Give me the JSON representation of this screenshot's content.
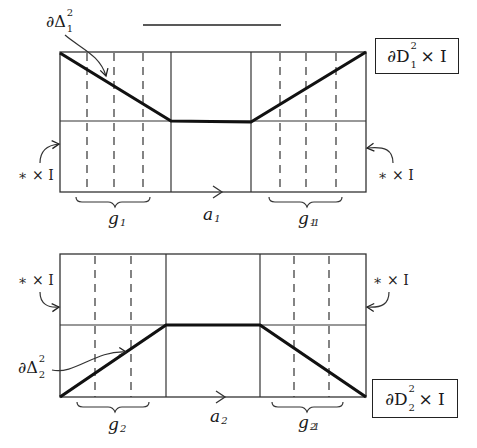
{
  "figure": {
    "top_bar_line": {
      "x1": 143,
      "y1": 25,
      "x2": 281,
      "y2": 25
    },
    "top_diagram": {
      "label_box": {
        "symbol": "∂D",
        "sup": "2",
        "sub": "1",
        "suffix": "× I"
      },
      "boundary_label": {
        "symbol": "∂Δ",
        "sup": "2",
        "sub": "1"
      },
      "left_label": "∗ × I",
      "right_label": "∗ × I",
      "brace_left": {
        "base": "g",
        "sub": "1",
        "sup": ""
      },
      "brace_right": {
        "base": "g",
        "sub": "1",
        "sup": "-1"
      },
      "arrow_label": {
        "base": "a",
        "sub": "1"
      },
      "rect": {
        "x": 60,
        "y": 52,
        "w": 306,
        "h": 140
      },
      "mid_y": 121,
      "solid_verticals": [
        171,
        251
      ],
      "dashed_left": [
        87,
        114,
        143
      ],
      "dashed_right": [
        280,
        306,
        336
      ],
      "path": [
        [
          60,
          53
        ],
        [
          171,
          121
        ],
        [
          251,
          122
        ],
        [
          366,
          52
        ]
      ]
    },
    "bottom_diagram": {
      "label_box": {
        "symbol": "∂D",
        "sup": "2",
        "sub": "2",
        "suffix": "× I"
      },
      "boundary_label": {
        "symbol": "∂Δ",
        "sup": "2",
        "sub": "2"
      },
      "left_label": "∗ × I",
      "right_label": "∗ × I",
      "brace_left": {
        "base": "g",
        "sub": "2",
        "sup": ""
      },
      "brace_right": {
        "base": "g",
        "sub": "2",
        "sup": "-1"
      },
      "arrow_label": {
        "base": "a",
        "sub": "2"
      },
      "rect": {
        "x": 60,
        "y": 254,
        "w": 306,
        "h": 143
      },
      "mid_y": 325,
      "solid_verticals": [
        166,
        260
      ],
      "dashed_left": [
        95,
        131
      ],
      "dashed_right": [
        294,
        329
      ],
      "path": [
        [
          60,
          397
        ],
        [
          166,
          325
        ],
        [
          260,
          325
        ],
        [
          366,
          397
        ]
      ]
    }
  }
}
